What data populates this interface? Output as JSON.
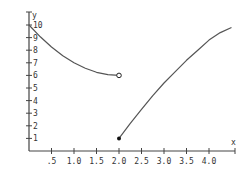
{
  "chart_data": {
    "type": "line",
    "title": "",
    "xlabel": "x",
    "ylabel": "y",
    "xlim": [
      0,
      4.6
    ],
    "ylim": [
      0,
      10.5
    ],
    "grid": false,
    "x_ticks": [
      0.5,
      1.0,
      1.5,
      2.0,
      2.5,
      3.0,
      3.5,
      4.0
    ],
    "x_tick_labels": [
      ".5",
      "1.0",
      "1.5",
      "2.0",
      "2.5",
      "3.0",
      "3.5",
      "4.0"
    ],
    "y_ticks": [
      1,
      2,
      3,
      4,
      5,
      6,
      7,
      8,
      9,
      10
    ],
    "y_tick_labels": [
      "1",
      "2",
      "3",
      "4",
      "5",
      "6",
      "7",
      "8",
      "9",
      "10"
    ],
    "series": [
      {
        "name": "left piece",
        "x": [
          0,
          0.25,
          0.5,
          0.75,
          1.0,
          1.25,
          1.5,
          1.75,
          2.0
        ],
        "y": [
          10,
          9.06,
          8.25,
          7.56,
          7.0,
          6.56,
          6.25,
          6.06,
          6.0
        ],
        "end_marker": "open-circle",
        "end_point": [
          2.0,
          6.0
        ]
      },
      {
        "name": "right piece",
        "x": [
          2.0,
          2.25,
          2.5,
          2.75,
          3.0,
          3.25,
          3.5,
          3.75,
          4.0,
          4.25,
          4.5
        ],
        "y": [
          1.0,
          2.2,
          3.3,
          4.4,
          5.4,
          6.3,
          7.2,
          8.0,
          8.8,
          9.4,
          9.8
        ],
        "start_marker": "filled-dot",
        "start_point": [
          2.0,
          1.0
        ]
      }
    ],
    "legend": null,
    "colors": {
      "axis": "#444444",
      "curve": "#555555",
      "text": "#333333"
    }
  }
}
